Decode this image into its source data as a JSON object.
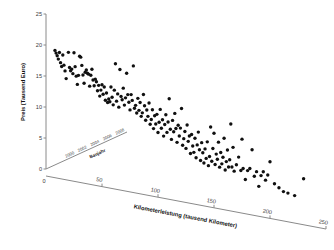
{
  "chart_data": {
    "type": "scatter",
    "title": "",
    "xlabel": "Kilometerleistung (tausend Kilometer)",
    "ylabel": "Preis (Tausend Euro)",
    "zlabel": "Baujahr",
    "xlim": [
      0,
      250
    ],
    "ylim": [
      0,
      25
    ],
    "zlim": [
      1999,
      2009
    ],
    "grid": false,
    "legend": null,
    "projection": "3d-oblique",
    "xticks": [
      0,
      50,
      100,
      150,
      200,
      250
    ],
    "xtick_labels": [
      "0",
      "50",
      "100",
      "150",
      "200",
      "250"
    ],
    "yticks": [
      0,
      5,
      10,
      15,
      20,
      25
    ],
    "ytick_labels": [
      "0",
      "5",
      "10",
      "15",
      "20",
      "25"
    ],
    "zticks": [
      2000,
      2002,
      2004,
      2006,
      2008
    ],
    "ztick_labels": [
      "2000",
      "2002",
      "2004",
      "2006",
      "2008"
    ],
    "marker": "filled-circle",
    "marker_color": "#101010",
    "marker_size": 2,
    "background_color": "#ffffff",
    "axis_color": "#8a8a8a",
    "points": [
      [
        8,
        19.4
      ],
      [
        9,
        19.0
      ],
      [
        10,
        18.6
      ],
      [
        11,
        18.1
      ],
      [
        12,
        19.2
      ],
      [
        13,
        17.6
      ],
      [
        14,
        17.0
      ],
      [
        15,
        18.9
      ],
      [
        16,
        17.3
      ],
      [
        17,
        16.4
      ],
      [
        18,
        15.2
      ],
      [
        20,
        19.5
      ],
      [
        21,
        17.1
      ],
      [
        22,
        16.6
      ],
      [
        23,
        16.9
      ],
      [
        24,
        16.2
      ],
      [
        25,
        19.6
      ],
      [
        26,
        17.4
      ],
      [
        27,
        15.9
      ],
      [
        28,
        14.6
      ],
      [
        29,
        16.1
      ],
      [
        30,
        19.2
      ],
      [
        31,
        19.1
      ],
      [
        32,
        17.8
      ],
      [
        33,
        16.3
      ],
      [
        34,
        15.0
      ],
      [
        35,
        16.8
      ],
      [
        36,
        17.2
      ],
      [
        37,
        16.7
      ],
      [
        38,
        16.6
      ],
      [
        39,
        14.7
      ],
      [
        40,
        16.5
      ],
      [
        41,
        17.5
      ],
      [
        42,
        15.8
      ],
      [
        43,
        14.9
      ],
      [
        44,
        16.0
      ],
      [
        45,
        15.6
      ],
      [
        46,
        14.2
      ],
      [
        47,
        15.1
      ],
      [
        48,
        13.4
      ],
      [
        49,
        14.4
      ],
      [
        50,
        15.3
      ],
      [
        51,
        13.8
      ],
      [
        52,
        15.0
      ],
      [
        53,
        12.9
      ],
      [
        54,
        14.1
      ],
      [
        55,
        12.6
      ],
      [
        56,
        13.2
      ],
      [
        57,
        12.8
      ],
      [
        58,
        15.2
      ],
      [
        59,
        13.6
      ],
      [
        60,
        12.4
      ],
      [
        61,
        14.8
      ],
      [
        62,
        19.1
      ],
      [
        63,
        13.1
      ],
      [
        64,
        14.3
      ],
      [
        65,
        12.2
      ],
      [
        66,
        18.3
      ],
      [
        67,
        14.0
      ],
      [
        68,
        13.5
      ],
      [
        69,
        15.4
      ],
      [
        70,
        12.7
      ],
      [
        71,
        13.9
      ],
      [
        72,
        17.9
      ],
      [
        73,
        14.5
      ],
      [
        74,
        13.3
      ],
      [
        75,
        12.1
      ],
      [
        76,
        14.6
      ],
      [
        77,
        13.7
      ],
      [
        78,
        19.3
      ],
      [
        79,
        12.5
      ],
      [
        80,
        13.0
      ],
      [
        81,
        11.8
      ],
      [
        82,
        14.2
      ],
      [
        83,
        12.3
      ],
      [
        84,
        13.6
      ],
      [
        85,
        11.4
      ],
      [
        86,
        12.0
      ],
      [
        87,
        15.0
      ],
      [
        88,
        13.2
      ],
      [
        89,
        10.9
      ],
      [
        90,
        12.6
      ],
      [
        91,
        11.6
      ],
      [
        92,
        13.8
      ],
      [
        93,
        10.4
      ],
      [
        94,
        11.2
      ],
      [
        95,
        12.8
      ],
      [
        96,
        9.8
      ],
      [
        97,
        11.9
      ],
      [
        98,
        10.6
      ],
      [
        99,
        12.2
      ],
      [
        100,
        9.3
      ],
      [
        101,
        11.0
      ],
      [
        102,
        13.1
      ],
      [
        103,
        10.1
      ],
      [
        104,
        11.5
      ],
      [
        105,
        8.9
      ],
      [
        106,
        10.8
      ],
      [
        107,
        12.4
      ],
      [
        108,
        9.6
      ],
      [
        109,
        11.3
      ],
      [
        110,
        15.1
      ],
      [
        111,
        10.2
      ],
      [
        112,
        8.6
      ],
      [
        113,
        11.7
      ],
      [
        114,
        9.9
      ],
      [
        115,
        12.9
      ],
      [
        116,
        10.5
      ],
      [
        117,
        8.3
      ],
      [
        118,
        11.1
      ],
      [
        119,
        9.4
      ],
      [
        120,
        10.7
      ],
      [
        121,
        13.9
      ],
      [
        122,
        8.0
      ],
      [
        123,
        9.1
      ],
      [
        124,
        10.3
      ],
      [
        125,
        7.6
      ],
      [
        126,
        11.4
      ],
      [
        127,
        8.8
      ],
      [
        128,
        9.7
      ],
      [
        129,
        6.9
      ],
      [
        130,
        10.0
      ],
      [
        131,
        8.2
      ],
      [
        132,
        7.2
      ],
      [
        133,
        9.5
      ],
      [
        134,
        6.4
      ],
      [
        135,
        8.5
      ],
      [
        136,
        10.6
      ],
      [
        137,
        7.8
      ],
      [
        138,
        6.1
      ],
      [
        139,
        9.0
      ],
      [
        140,
        7.4
      ],
      [
        141,
        5.8
      ],
      [
        142,
        8.1
      ],
      [
        143,
        6.6
      ],
      [
        144,
        9.3
      ],
      [
        145,
        5.5
      ],
      [
        146,
        7.0
      ],
      [
        147,
        11.8
      ],
      [
        148,
        6.3
      ],
      [
        149,
        8.4
      ],
      [
        150,
        10.9
      ],
      [
        151,
        5.9
      ],
      [
        152,
        7.6
      ],
      [
        153,
        6.8
      ],
      [
        154,
        9.6
      ],
      [
        155,
        5.6
      ],
      [
        156,
        8.0
      ],
      [
        157,
        6.2
      ],
      [
        158,
        7.3
      ],
      [
        159,
        10.4
      ],
      [
        160,
        5.3
      ],
      [
        161,
        6.7
      ],
      [
        162,
        8.6
      ],
      [
        163,
        5.9
      ],
      [
        164,
        7.1
      ],
      [
        165,
        12.9
      ],
      [
        166,
        6.0
      ],
      [
        167,
        9.2
      ],
      [
        168,
        5.4
      ],
      [
        170,
        6.5
      ],
      [
        172,
        7.8
      ],
      [
        174,
        5.7
      ],
      [
        175,
        10.8
      ],
      [
        176,
        6.1
      ],
      [
        178,
        4.4
      ],
      [
        180,
        5.9
      ],
      [
        182,
        6.3
      ],
      [
        184,
        9.4
      ],
      [
        186,
        5.2
      ],
      [
        188,
        6.0
      ],
      [
        190,
        3.7
      ],
      [
        192,
        5.5
      ],
      [
        194,
        6.2
      ],
      [
        196,
        4.9
      ],
      [
        198,
        5.8
      ],
      [
        200,
        8.0
      ],
      [
        204,
        4.6
      ],
      [
        208,
        4.1
      ],
      [
        212,
        3.6
      ],
      [
        216,
        3.5
      ],
      [
        222,
        3.3
      ],
      [
        230,
        6.3
      ]
    ]
  },
  "axes": {
    "y_axis_title": "Preis (Tausend Euro)",
    "x_axis_title": "Kilometerleistung (tausend Kilometer)",
    "z_axis_title": "Baujahr"
  }
}
